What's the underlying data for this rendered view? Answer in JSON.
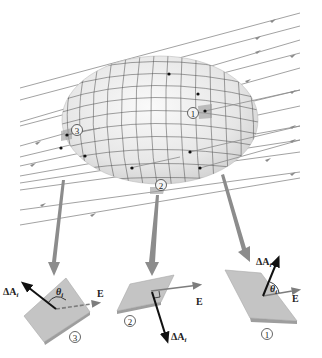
{
  "figure": {
    "field_label": "E",
    "colors": {
      "field_lines": "#8a8a8a",
      "surface_fill": "#ececec",
      "grid_lines": "#555555",
      "pointer_arrows": "#8c8c8c",
      "patch_fill": "#c4c4c4",
      "vector": "#111111"
    }
  },
  "surface_markers": [
    {
      "id": "1",
      "symbol": "①"
    },
    {
      "id": "2",
      "symbol": "②"
    },
    {
      "id": "3",
      "symbol": "③"
    }
  ],
  "insets": [
    {
      "id": "3",
      "symbol": "③",
      "area_label": "ΔA",
      "area_sub": "i",
      "angle_label": "θ",
      "angle_sub": "i",
      "field_label": "E",
      "relation": "angle > 90°"
    },
    {
      "id": "2",
      "symbol": "②",
      "area_label": "ΔA",
      "area_sub": "i",
      "field_label": "E",
      "relation": "perpendicular"
    },
    {
      "id": "1",
      "symbol": "①",
      "area_label": "ΔA",
      "area_sub": "i",
      "angle_label": "θ",
      "angle_sub": "i",
      "field_label": "E",
      "relation": "angle < 90°"
    }
  ]
}
